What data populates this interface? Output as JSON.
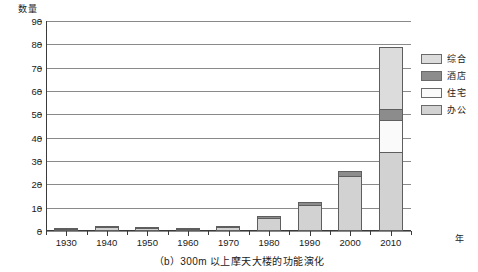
{
  "chart_data": {
    "type": "bar",
    "subtype": "stacked-bar",
    "title": "",
    "caption": "（b）300m 以上摩天大楼的功能演化",
    "xlabel": "年",
    "ylabel": "数量",
    "ylim": [
      0,
      90
    ],
    "ytick_step": 10,
    "yticks": [
      0,
      10,
      20,
      30,
      40,
      50,
      60,
      70,
      80,
      90
    ],
    "ytick_labels": [
      "0",
      "10",
      "20",
      "30",
      "40",
      "50",
      "60",
      "70",
      "80",
      "90"
    ],
    "grid": true,
    "grid_axis": "y",
    "legend_position": "right",
    "categories": [
      "1930",
      "1940",
      "1950",
      "1960",
      "1970",
      "1980",
      "1990",
      "2000",
      "2010"
    ],
    "series": [
      {
        "name": "办公",
        "color": "#d2d2d2",
        "values": [
          0.8,
          1.6,
          1.2,
          0.9,
          1.8,
          5.5,
          11.0,
          23.5,
          34.0
        ]
      },
      {
        "name": "住宅",
        "color": "#fafafa",
        "values": [
          0,
          0,
          0,
          0,
          0,
          0,
          0,
          0,
          14.0
        ]
      },
      {
        "name": "酒店",
        "color": "#8c8c8c",
        "values": [
          0.4,
          0.6,
          0.5,
          0.4,
          0.8,
          1.5,
          1.8,
          2.5,
          5.0
        ]
      },
      {
        "name": "综合",
        "color": "#dcdcdc",
        "values": [
          0,
          0,
          0,
          0,
          0,
          0,
          0,
          0,
          27.0
        ]
      }
    ],
    "totals": [
      1.2,
      2.2,
      1.7,
      1.3,
      2.6,
      7.0,
      12.8,
      26.0,
      80.0
    ],
    "stack_order_bottom_to_top": [
      "办公",
      "住宅",
      "酒店",
      "综合"
    ]
  },
  "legend": {
    "items": [
      {
        "label": "综合",
        "color": "#dcdcdc"
      },
      {
        "label": "酒店",
        "color": "#8c8c8c"
      },
      {
        "label": "住宅",
        "color": "#fafafa"
      },
      {
        "label": "办公",
        "color": "#d2d2d2"
      }
    ]
  },
  "axes": {
    "y_title": "数量",
    "x_title": "年"
  },
  "figure": {
    "caption": "（b）300m 以上摩天大楼的功能演化"
  },
  "colors": {
    "axis": "#3a3a3a",
    "grid": "#8a8a8a",
    "bar_outline": "#5e5e5e",
    "text": "#1a1a1a",
    "background": "#ffffff"
  }
}
